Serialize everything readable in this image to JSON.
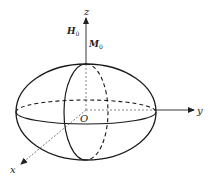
{
  "diagram": {
    "axes": {
      "x_label": "x",
      "y_label": "y",
      "z_label": "z",
      "origin_label": "O"
    },
    "vectors": {
      "field": {
        "symbol": "H",
        "subscript": "0"
      },
      "magnetization": {
        "symbol": "M",
        "subscript": "0"
      }
    },
    "colors": {
      "stroke": "#1a1a1a",
      "axis": "#333333",
      "background": "#ffffff"
    }
  }
}
